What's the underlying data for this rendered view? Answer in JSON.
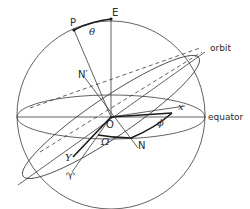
{
  "diagram": {
    "type": "celestial sphere with orbital elements",
    "colors": {
      "line": "#3a3a3a",
      "bold_line": "#1a1a1a",
      "background": "#ffffff"
    },
    "labels": {
      "pole_point": "P",
      "equator_pole": "E",
      "theta": "θ",
      "orbit_node_upper": "N′",
      "origin": "O",
      "orbit": "orbit",
      "equator": "equator",
      "x_axis": "x",
      "y_axis": "Y",
      "phi": "ϕ",
      "ascending_node_longitude": "Ω",
      "node": "N",
      "vernal_equinox": "♈"
    }
  }
}
